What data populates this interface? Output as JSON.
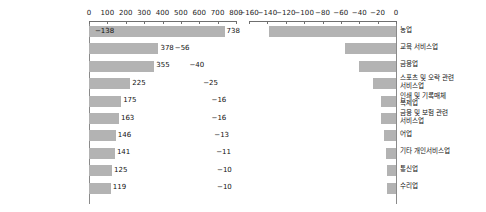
{
  "chart_data": [
    {
      "type": "bar",
      "orientation": "horizontal",
      "panel": "left",
      "title": "",
      "xlabel": "",
      "ylabel": "",
      "xlim": [
        0,
        800
      ],
      "xticks": [
        0,
        100,
        200,
        300,
        400,
        500,
        600,
        700,
        800
      ],
      "xtick_labels": [
        "0",
        "100",
        "200",
        "300",
        "400",
        "500",
        "600",
        "700",
        "800"
      ],
      "grid": false,
      "bar_color": "#b3b3b3",
      "categories": [
        "사회복지 서비스업",
        "사업지원 서비스업",
        "보건업",
        "소매업; 자동차 제외",
        "연구개발업",
        "공공행정, 국방 및\n사회보장 행정",
        "육상운송 및\n파이프라인 운송업",
        "도매 및 상품중개업",
        "전문 서비스업",
        "출판업"
      ],
      "values": [
        738,
        378,
        355,
        225,
        175,
        163,
        146,
        141,
        125,
        119
      ],
      "value_labels": [
        "738",
        "378",
        "355",
        "225",
        "175",
        "163",
        "146",
        "141",
        "125",
        "119"
      ]
    },
    {
      "type": "bar",
      "orientation": "horizontal",
      "panel": "right",
      "title": "",
      "xlabel": "",
      "ylabel": "",
      "xlim": [
        -160,
        0
      ],
      "xticks": [
        -160,
        -140,
        -120,
        -100,
        -80,
        -60,
        -40,
        -20,
        0
      ],
      "xtick_labels": [
        "−160",
        "−140",
        "−120",
        "−100",
        "−80",
        "−60",
        "−40",
        "−20",
        "0"
      ],
      "grid": false,
      "bar_color": "#b3b3b3",
      "categories": [
        "농업",
        "교육 서비스업",
        "금융업",
        "스포츠 및 오락 관련\n서비스업",
        "인쇄 및 기록매체\n복제업",
        "금융 및 보험 관련\n서비스업",
        "어업",
        "기타 개인서비스업",
        "통신업",
        "수리업"
      ],
      "values": [
        -138,
        -56,
        -40,
        -25,
        -16,
        -16,
        -13,
        -11,
        -10,
        -10
      ],
      "value_labels": [
        "−138",
        "−56",
        "−40",
        "−25",
        "−16",
        "−16",
        "−13",
        "−11",
        "−10",
        "−10"
      ]
    }
  ]
}
